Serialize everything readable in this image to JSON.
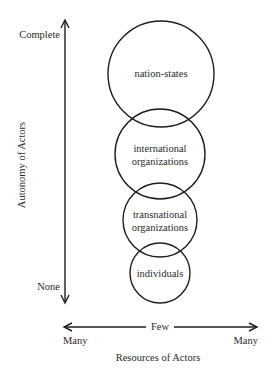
{
  "diagram": {
    "y_axis": {
      "label": "Autonomy of Actors",
      "top_label": "Complete",
      "bottom_label": "None"
    },
    "x_axis": {
      "label": "Resources of Actors",
      "center_label": "Few",
      "left_label": "Many",
      "right_label": "Many"
    },
    "circles": [
      {
        "label_lines": [
          "nation-states"
        ],
        "cx": 161,
        "cy": 74,
        "r": 53
      },
      {
        "label_lines": [
          "international",
          "organizations"
        ],
        "cx": 160,
        "cy": 154,
        "r": 45
      },
      {
        "label_lines": [
          "transnational",
          "organizations"
        ],
        "cx": 160,
        "cy": 220,
        "r": 37
      },
      {
        "label_lines": [
          "individuals"
        ],
        "cx": 160,
        "cy": 273,
        "r": 30
      }
    ]
  }
}
